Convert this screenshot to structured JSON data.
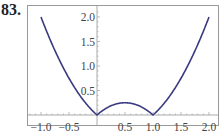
{
  "problem_number": "83.",
  "colors": {
    "curve": "#3a3a80",
    "axis": "#aaaaaa",
    "frame": "#888888",
    "text": "#444444"
  },
  "chart_data": {
    "type": "line",
    "title": "",
    "xlabel": "",
    "ylabel": "",
    "function": "y = |x^2 - x|",
    "xlim": [
      -1.2,
      2.15
    ],
    "ylim": [
      -0.15,
      2.2
    ],
    "grid": false,
    "x_ticks": [
      -1.0,
      -0.5,
      0.5,
      1.0,
      1.5,
      2.0
    ],
    "x_tick_labels": [
      "−1.0",
      "−0.5",
      "0.5",
      "1.0",
      "1.5",
      "2.0"
    ],
    "y_ticks": [
      0.5,
      1.0,
      1.5,
      2.0
    ],
    "y_tick_labels": [
      "0.5",
      "1.0",
      "1.5",
      "2.0"
    ],
    "series": [
      {
        "name": "f(x)",
        "x": [
          -1.0,
          -0.75,
          -0.5,
          -0.25,
          0.0,
          0.25,
          0.5,
          0.75,
          1.0,
          1.25,
          1.5,
          1.75,
          2.0
        ],
        "y": [
          2.0,
          1.3125,
          0.75,
          0.3125,
          0.0,
          0.1875,
          0.25,
          0.1875,
          0.0,
          0.3125,
          0.75,
          1.3125,
          2.0
        ]
      }
    ]
  }
}
